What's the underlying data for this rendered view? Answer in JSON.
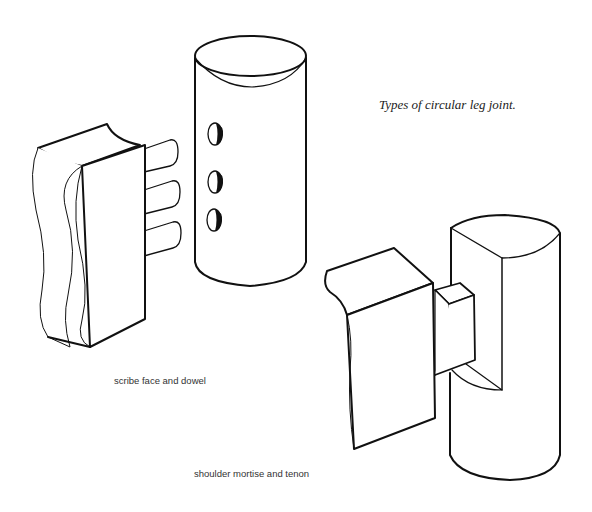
{
  "title": "Types of circular leg joint.",
  "figures": [
    {
      "id": "scribe-face-dowel",
      "caption": "scribe face and dowel",
      "dowel_count": 3,
      "hole_count": 3
    },
    {
      "id": "shoulder-mortise-tenon",
      "caption": "shoulder mortise and tenon"
    }
  ],
  "colors": {
    "ink": "#111111",
    "background": "#ffffff"
  }
}
